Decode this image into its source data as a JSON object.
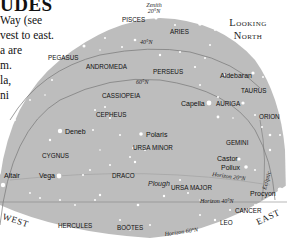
{
  "header": {
    "title_fragment": "UDES",
    "body_lines": [
      "Way (see",
      "vest to east.",
      "a are",
      "m.",
      "la,",
      "ni"
    ]
  },
  "orientation": {
    "line1": "Looking",
    "line2": "North"
  },
  "map": {
    "background_color": "#bdbdbd",
    "page_color": "#ffffff",
    "star_color": "#ffffff",
    "zenith": {
      "label": "Zenith",
      "latitude": "20°N"
    },
    "latitude_arcs": [
      {
        "label": "40°N"
      },
      {
        "label": "60°N"
      }
    ],
    "horizons": [
      {
        "label": "Horizon 20°N"
      },
      {
        "label": "Horizon 40°N"
      },
      {
        "label": "Horizon 60°N"
      }
    ],
    "ecliptic_label": "Ecliptic",
    "directions": {
      "west": "WEST",
      "east": "EAST"
    },
    "constellations": [
      "PISCES",
      "ARIES",
      "PEGASUS",
      "ANDROMEDA",
      "PERSEUS",
      "TAURUS",
      "CASSIOPEIA",
      "AURIGA",
      "CEPHEUS",
      "ORION",
      "URSA MINOR",
      "GEMINI",
      "CYGNUS",
      "DRACO",
      "URSA MAJOR",
      "CANCER",
      "HERCULES",
      "BOÖTES",
      "LEO"
    ],
    "asterisms": [
      "Plough"
    ],
    "stars": [
      "Aldebaran",
      "Capella",
      "Deneb",
      "Polaris",
      "Castor",
      "Pollux",
      "Altair",
      "Vega",
      "Procyon"
    ]
  }
}
